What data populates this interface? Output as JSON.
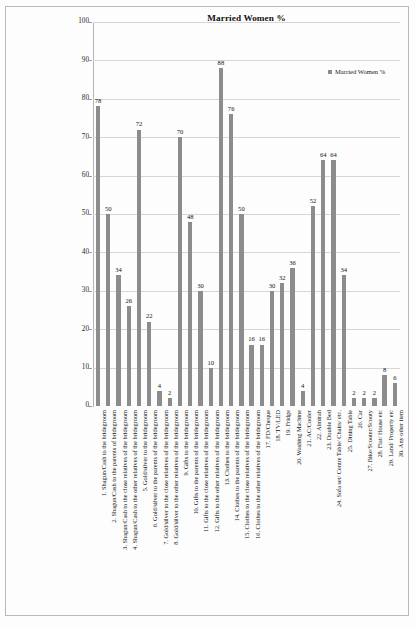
{
  "chart_data": {
    "type": "bar",
    "title": "Married Women %",
    "xlabel": "",
    "ylabel": "",
    "ylim": [
      0,
      100
    ],
    "ytick_step": 10,
    "yticks": [
      0,
      10,
      20,
      30,
      40,
      50,
      60,
      70,
      80,
      90,
      100
    ],
    "grid": true,
    "legend": {
      "position": "top-right",
      "entries": [
        "Married Women %"
      ]
    },
    "series_name": "Married Women %",
    "bar_color": "#8c8c8c",
    "categories": [
      "1.  Shagun/Cash to the bridegroom",
      "2.  Shagun/Cash to the parents of bridegroom",
      "3.  Shagun/Cash to the close relatives of the bridegroom",
      "4.  Shagun/Cash to the other relatives of the bridegroom",
      "5.  Gold/silver to the bridegroom",
      "6.  Gold/silver to the parents of the bridegroom",
      "7.  Gold/silver to the close relatives of the bridegroom",
      "8.  Gold/silver to the other relatives of the bridegroom",
      "9.  Gifts to the bridegroom",
      "10.  Gifts to the parents of the bridegroom",
      "11.  Gifts to the close relatives of the bridegroom",
      "12.  Gifts to the other relatives of the bridegroom",
      "13.  Clothes to the bridegroom",
      "14.  Clothes to the parents of the bridegroom",
      "15.  Clothes to the close relatives of the bridegroom",
      "16.  Clothes to the other relatives of the bridegroom",
      "17.  FD/Cheque",
      "18.  TV/LED",
      "19.  Fridge",
      "20.  Washing Machine",
      "21.  AC/Cooler",
      "22.  Almirah",
      "23.  Double Bed",
      "24.  Sofa set/ Centre Table/ Chairs/ etc.",
      "25.  Dining Table",
      "26.  Car",
      "27.  Bike/Scooter/Scooty",
      "28.  Flat/ House etc",
      "29.  Land/ Property etc",
      "30.  Any other item"
    ],
    "values": [
      78,
      50,
      34,
      26,
      72,
      22,
      4,
      2,
      70,
      48,
      30,
      10,
      88,
      76,
      50,
      16,
      16,
      30,
      32,
      36,
      4,
      52,
      64,
      64,
      34,
      2,
      2,
      2,
      8,
      6
    ],
    "value_labels": [
      "78",
      "50",
      "34",
      "26",
      "72",
      "22",
      "4",
      "2",
      "70",
      "48",
      "30",
      "10",
      "88",
      "76",
      "50",
      "16",
      "16",
      "30",
      "32",
      "36",
      "4",
      "52",
      "64",
      "64",
      "34",
      "2",
      "2",
      "2",
      "8",
      "6"
    ]
  }
}
